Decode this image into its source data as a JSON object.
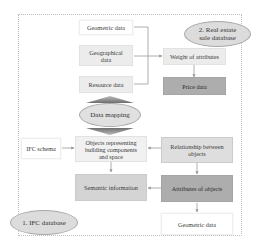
{
  "databases": {
    "ifc": "1. IFC database",
    "real_estate": "2. Real estate sale database"
  },
  "real_estate_line1": "2. Real estate",
  "real_estate_line2": "sale database",
  "nodes": {
    "geometric_data_top": "Geometric data",
    "geographical_data_l1": "Geographical",
    "geographical_data_l2": "data",
    "resource_data": "Resource data",
    "weight_of_attributes": "Weight of attributes",
    "price_data": "Price data",
    "data_mapping": "Data mapping",
    "ifc_schema": "IFC schema",
    "objects_l1": "Objects representing",
    "objects_l2": "building components",
    "objects_l3": "and space",
    "relationship_l1": "Relationship between",
    "relationship_l2": "objects",
    "semantic_information": "Semantic information",
    "attributes_of_objects": "Attributes of  objects",
    "geometric_data_bottom": "Geometric data"
  },
  "colors": {
    "white_box": "#ffffff",
    "light_box": "#ececec",
    "mid_box": "#d4d4d4",
    "dark_box": "#adadad",
    "ellipse": "#dcdcdc",
    "arrow": "#9a9a9a",
    "mapping_arrow": "#7a7a7a"
  }
}
